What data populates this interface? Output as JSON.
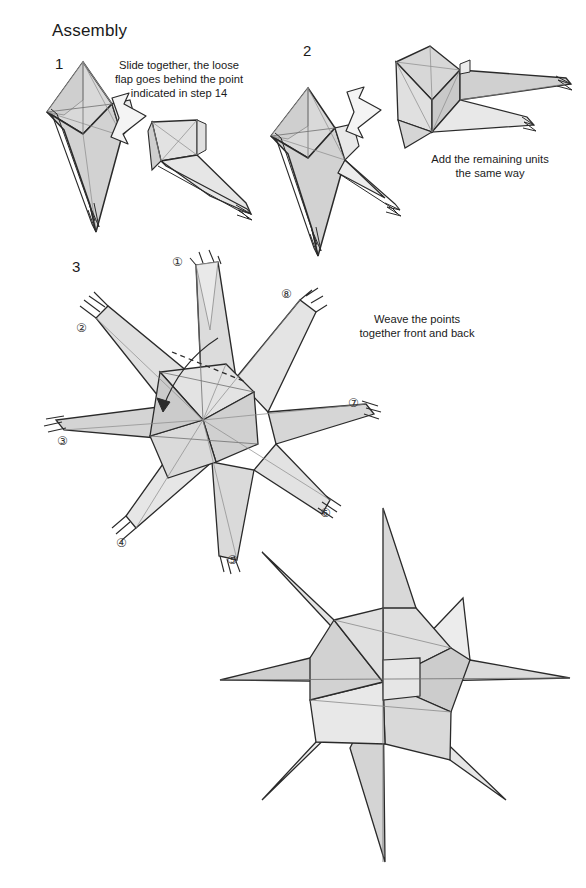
{
  "document": {
    "title": "Assembly",
    "kind": "origami-assembly-diagram"
  },
  "steps": [
    {
      "number": "1",
      "note": "Slide together, the loose\nflap goes behind the point\nindicated in step 14"
    },
    {
      "number": "2",
      "note": "Add the remaining units\nthe same way"
    },
    {
      "number": "3",
      "note": "Weave the points\ntogether front and back"
    }
  ],
  "unit_labels": [
    {
      "label": "①",
      "x": 172,
      "y": 255
    },
    {
      "label": "②",
      "x": 76,
      "y": 321
    },
    {
      "label": "③",
      "x": 57,
      "y": 434
    },
    {
      "label": "④",
      "x": 116,
      "y": 536
    },
    {
      "label": "⑤",
      "x": 227,
      "y": 553
    },
    {
      "label": "⑥",
      "x": 320,
      "y": 506
    },
    {
      "label": "⑦",
      "x": 348,
      "y": 396
    },
    {
      "label": "⑧",
      "x": 281,
      "y": 287
    }
  ],
  "colors": {
    "ink": "#1f1f1f",
    "outline": "#2a2a2a",
    "crease": "#8a8a8a",
    "paper_light": "#ededed",
    "paper_mid": "#dcdcdc",
    "paper_dark": "#c9c9c9",
    "paper_shadow": "#bdbdbd",
    "background": "#ffffff"
  },
  "figures": {
    "step1": "two kite-shaped origami units with a long tapered point, joined by a push arrow",
    "step2": "three units joined in a chain, push arrow indicating the next unit",
    "step3": "eight units woven into an eight-point pinwheel star with a dashed hidden edge and a tuck arrow",
    "final": "completed eight-point woven modular star"
  }
}
